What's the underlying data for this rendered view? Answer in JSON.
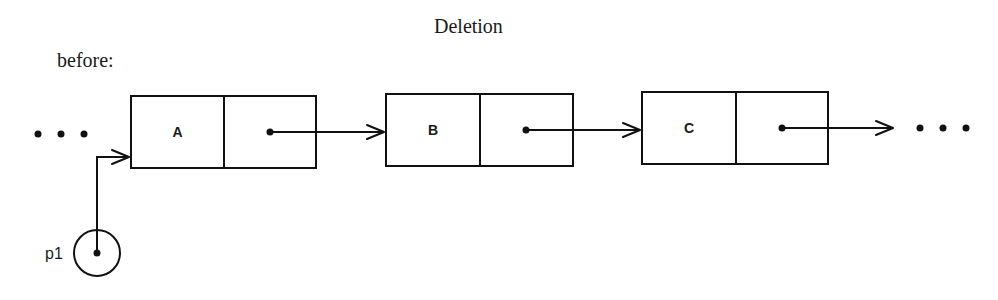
{
  "title": "Deletion",
  "subtitle": "before:",
  "colors": {
    "ink": "#111111",
    "background": "#ffffff"
  },
  "ellipsis_left": {
    "label": "...",
    "dots_x": [
      38,
      61,
      84
    ],
    "y": 134
  },
  "ellipsis_right": {
    "label": "...",
    "dots_x": [
      920,
      943,
      966
    ],
    "y": 128
  },
  "nodes": [
    {
      "id": "A",
      "value": "A",
      "box": {
        "x": 131,
        "y": 96,
        "w": 185,
        "h": 72
      },
      "divider_x": 224,
      "next_ptr": {
        "x1": 270,
        "y": 132,
        "x2": 384
      }
    },
    {
      "id": "B",
      "value": "B",
      "box": {
        "x": 386,
        "y": 94,
        "w": 187,
        "h": 72
      },
      "divider_x": 480,
      "next_ptr": {
        "x1": 526,
        "y": 130,
        "x2": 640
      }
    },
    {
      "id": "C",
      "value": "C",
      "box": {
        "x": 642,
        "y": 92,
        "w": 186,
        "h": 72
      },
      "divider_x": 736,
      "next_ptr": {
        "x1": 782,
        "y": 128,
        "x2": 893
      }
    }
  ],
  "pointer": {
    "label": "p1",
    "target": "A",
    "circle": {
      "cx": 97,
      "cy": 253,
      "r": 23
    },
    "path": {
      "up_to_y": 157,
      "right_to_x": 129
    }
  }
}
